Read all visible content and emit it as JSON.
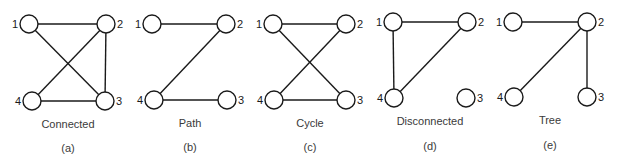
{
  "figure": {
    "node_radius": 9,
    "stroke_color": "#1a1a1a",
    "text_color": "#3a3a3a",
    "panels": [
      {
        "id": "a",
        "caption": "Connected",
        "sublabel": "(a)",
        "caption_x": 68,
        "caption_y": 128,
        "sublabel_y": 152,
        "nodes": [
          {
            "id": "1",
            "label": "1",
            "x": 29,
            "y": 24,
            "label_side": "left"
          },
          {
            "id": "2",
            "label": "2",
            "x": 106,
            "y": 24,
            "label_side": "right"
          },
          {
            "id": "3",
            "label": "3",
            "x": 105,
            "y": 101,
            "label_side": "right"
          },
          {
            "id": "4",
            "label": "4",
            "x": 32,
            "y": 101,
            "label_side": "left"
          }
        ],
        "edges": [
          [
            "1",
            "2"
          ],
          [
            "1",
            "3"
          ],
          [
            "2",
            "3"
          ],
          [
            "2",
            "4"
          ],
          [
            "4",
            "3"
          ]
        ]
      },
      {
        "id": "b",
        "caption": "Path",
        "sublabel": "(b)",
        "caption_x": 190,
        "caption_y": 127,
        "sublabel_y": 151,
        "nodes": [
          {
            "id": "1",
            "label": "1",
            "x": 152,
            "y": 24,
            "label_side": "left"
          },
          {
            "id": "2",
            "label": "2",
            "x": 226,
            "y": 24,
            "label_side": "right"
          },
          {
            "id": "3",
            "label": "3",
            "x": 227,
            "y": 100,
            "label_side": "right"
          },
          {
            "id": "4",
            "label": "4",
            "x": 154,
            "y": 100,
            "label_side": "left"
          }
        ],
        "edges": [
          [
            "1",
            "2"
          ],
          [
            "2",
            "4"
          ],
          [
            "4",
            "3"
          ]
        ]
      },
      {
        "id": "c",
        "caption": "Cycle",
        "sublabel": "(c)",
        "caption_x": 310,
        "caption_y": 127,
        "sublabel_y": 151,
        "nodes": [
          {
            "id": "1",
            "label": "1",
            "x": 273,
            "y": 24,
            "label_side": "left"
          },
          {
            "id": "2",
            "label": "2",
            "x": 346,
            "y": 24,
            "label_side": "right"
          },
          {
            "id": "3",
            "label": "3",
            "x": 346,
            "y": 100,
            "label_side": "right"
          },
          {
            "id": "4",
            "label": "4",
            "x": 274,
            "y": 100,
            "label_side": "left"
          }
        ],
        "edges": [
          [
            "1",
            "2"
          ],
          [
            "1",
            "3"
          ],
          [
            "2",
            "4"
          ],
          [
            "4",
            "3"
          ]
        ]
      },
      {
        "id": "d",
        "caption": "Disconnected",
        "sublabel": "(d)",
        "caption_x": 430,
        "caption_y": 125,
        "sublabel_y": 150,
        "nodes": [
          {
            "id": "1",
            "label": "1",
            "x": 393,
            "y": 22,
            "label_side": "left"
          },
          {
            "id": "2",
            "label": "2",
            "x": 467,
            "y": 22,
            "label_side": "right"
          },
          {
            "id": "3",
            "label": "3",
            "x": 466,
            "y": 98,
            "label_side": "right"
          },
          {
            "id": "4",
            "label": "4",
            "x": 394,
            "y": 98,
            "label_side": "left"
          }
        ],
        "edges": [
          [
            "1",
            "2"
          ],
          [
            "1",
            "4"
          ],
          [
            "2",
            "4"
          ]
        ]
      },
      {
        "id": "e",
        "caption": "Tree",
        "sublabel": "(e)",
        "caption_x": 550,
        "caption_y": 124,
        "sublabel_y": 149,
        "nodes": [
          {
            "id": "1",
            "label": "1",
            "x": 513,
            "y": 22,
            "label_side": "left"
          },
          {
            "id": "2",
            "label": "2",
            "x": 587,
            "y": 22,
            "label_side": "right"
          },
          {
            "id": "3",
            "label": "3",
            "x": 587,
            "y": 97,
            "label_side": "right"
          },
          {
            "id": "4",
            "label": "4",
            "x": 514,
            "y": 97,
            "label_side": "left"
          }
        ],
        "edges": [
          [
            "1",
            "2"
          ],
          [
            "2",
            "4"
          ],
          [
            "2",
            "3"
          ]
        ]
      }
    ]
  }
}
